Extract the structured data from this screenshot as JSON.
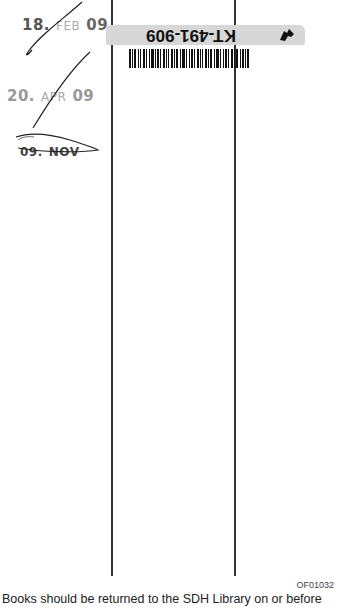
{
  "slip": {
    "stamps": [
      {
        "day": "18.",
        "month": "FEB",
        "year": "09",
        "crossed": true
      },
      {
        "day": "20.",
        "month": "APR",
        "year": "09",
        "crossed": true
      },
      {
        "day": "09.",
        "month": "NOV",
        "year": "",
        "crossed": true
      }
    ],
    "barcode_label": {
      "id": "KT-491-909",
      "orientation": "upside-down",
      "icon": "arrow-icon"
    },
    "form_code": "OF01032",
    "notice": "Books should be returned to the SDH Library on or before"
  },
  "colors": {
    "ink": "#222222",
    "label_band": "#d7d7d7",
    "paper": "#ffffff"
  }
}
